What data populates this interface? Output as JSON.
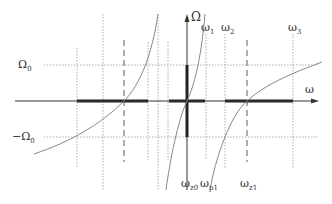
{
  "labels": {
    "y_axis": "Ω",
    "x_axis": "ω",
    "omega0_pos": "Ω",
    "omega0_pos_sub": "0",
    "omega0_neg": "−Ω",
    "omega0_neg_sub": "0",
    "w1": "ω",
    "w1_sub": "1",
    "w2": "ω",
    "w2_sub": "2",
    "w3": "ω",
    "w3_sub": "3",
    "wz0": "ω",
    "wz0_sub": "z0",
    "wp1": "ω",
    "wp1_sub": "p1",
    "wz1": "ω",
    "wz1_sub": "z1"
  },
  "colors": {
    "axis": "#333333",
    "curve": "#888888",
    "guide": "#999999",
    "thick": "#222222"
  }
}
